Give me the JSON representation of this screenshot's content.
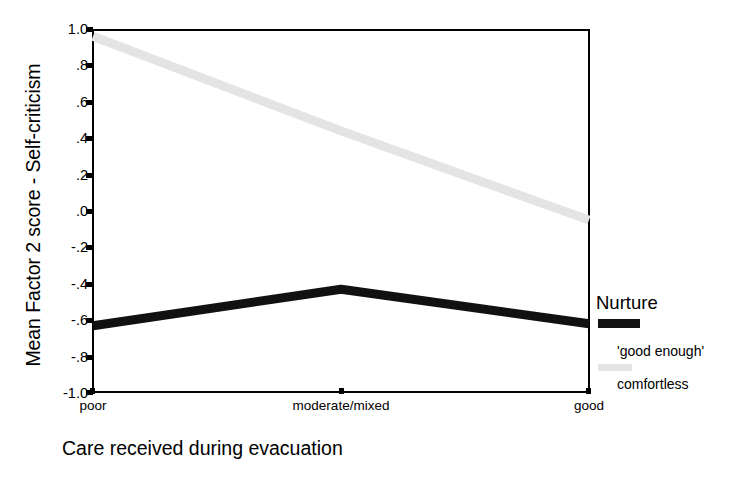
{
  "chart_data": {
    "type": "line",
    "title": "",
    "xlabel": "Care received during evacuation",
    "ylabel": "Mean Factor 2 score - Self-criticism",
    "categories": [
      "poor",
      "moderate/mixed",
      "good"
    ],
    "ylim": [
      -1.0,
      1.0
    ],
    "yticks": [
      "1.0",
      ".8",
      ".6",
      ".4",
      ".2",
      ".0",
      "-.2",
      "-.4",
      "-.6",
      "-.8",
      "-1.0"
    ],
    "ytick_values": [
      1.0,
      0.8,
      0.6,
      0.4,
      0.2,
      0.0,
      -0.2,
      -0.4,
      -0.6,
      -0.8,
      -1.0
    ],
    "grid": false,
    "legend_position": "right",
    "legend_title": "Nurture",
    "series": [
      {
        "name": "'good enough'",
        "color": "#e4e4e4",
        "values": [
          0.96,
          0.44,
          -0.05
        ]
      },
      {
        "name": "comfortless",
        "color": "#111111",
        "values": [
          -0.63,
          -0.43,
          -0.62
        ]
      }
    ]
  },
  "axes": {
    "y_title": "Mean Factor 2 score - Self-criticism",
    "x_title": "Care received during evacuation",
    "y_tick_labels": [
      "1.0",
      ".8",
      ".6",
      ".4",
      ".2",
      ".0",
      "-.2",
      "-.4",
      "-.6",
      "-.8",
      "-1.0"
    ],
    "x_tick_labels": [
      "poor",
      "moderate/mixed",
      "good"
    ]
  },
  "legend": {
    "title": "Nurture",
    "entries": [
      {
        "label": "'good enough'",
        "color": "#111111"
      },
      {
        "label": "comfortless",
        "color": "#e4e4e4"
      }
    ]
  }
}
